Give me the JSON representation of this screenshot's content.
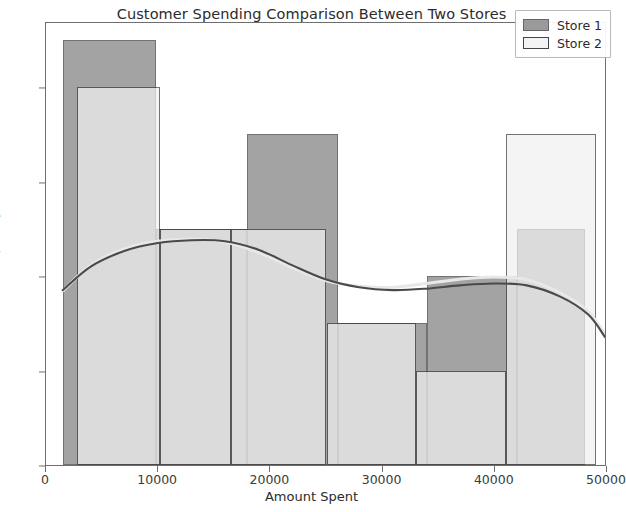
{
  "chart_data": {
    "type": "bar",
    "title": "Customer Spending Comparison Between Two Stores",
    "xlabel": "Amount Spent",
    "ylabel": "Frequency",
    "xlim": [
      0,
      50000
    ],
    "ylim": [
      0,
      9.4
    ],
    "grid": false,
    "legend_position": "upper right",
    "xticks": [
      "0",
      "10000",
      "20000",
      "30000",
      "40000",
      "50000"
    ],
    "xtick_values": [
      0,
      10000,
      20000,
      30000,
      40000,
      50000
    ],
    "yticks": [
      "0",
      "2",
      "4",
      "6",
      "8"
    ],
    "ytick_values": [
      0,
      2,
      4,
      6,
      8
    ],
    "series": [
      {
        "name": "Store 1",
        "color": "#808080",
        "edge_color": "#3c3c3c",
        "bins": [
          {
            "x0": 1500,
            "x1": 9800,
            "value": 9
          },
          {
            "x0": 9800,
            "x1": 17900,
            "value": 5
          },
          {
            "x0": 17900,
            "x1": 26000,
            "value": 7
          },
          {
            "x0": 26000,
            "x1": 34000,
            "value": 3
          },
          {
            "x0": 34000,
            "x1": 42000,
            "value": 4
          },
          {
            "x0": 42000,
            "x1": 48000,
            "value": 5
          }
        ],
        "kde": [
          [
            1500,
            3.72
          ],
          [
            4000,
            4.22
          ],
          [
            7000,
            4.55
          ],
          [
            10000,
            4.72
          ],
          [
            13000,
            4.78
          ],
          [
            16000,
            4.76
          ],
          [
            19000,
            4.58
          ],
          [
            22000,
            4.25
          ],
          [
            25000,
            3.95
          ],
          [
            28000,
            3.78
          ],
          [
            31000,
            3.72
          ],
          [
            34000,
            3.75
          ],
          [
            37000,
            3.82
          ],
          [
            40000,
            3.86
          ],
          [
            43000,
            3.82
          ],
          [
            46000,
            3.58
          ],
          [
            48500,
            3.2
          ],
          [
            50000,
            2.72
          ]
        ]
      },
      {
        "name": "Store 2",
        "color": "#f1f1f1",
        "edge_color": "#3c3c3c",
        "bins": [
          {
            "x0": 2800,
            "x1": 10200,
            "value": 8
          },
          {
            "x0": 10200,
            "x1": 16500,
            "value": 5
          },
          {
            "x0": 16500,
            "x1": 25000,
            "value": 5
          },
          {
            "x0": 25000,
            "x1": 33000,
            "value": 3
          },
          {
            "x0": 33000,
            "x1": 41000,
            "value": 2
          },
          {
            "x0": 41000,
            "x1": 49000,
            "value": 7
          }
        ],
        "kde": [
          [
            1500,
            3.7
          ],
          [
            4000,
            4.25
          ],
          [
            7000,
            4.6
          ],
          [
            10000,
            4.76
          ],
          [
            13000,
            4.8
          ],
          [
            16000,
            4.74
          ],
          [
            19000,
            4.52
          ],
          [
            22000,
            4.2
          ],
          [
            25000,
            3.92
          ],
          [
            28000,
            3.8
          ],
          [
            31000,
            3.78
          ],
          [
            34000,
            3.86
          ],
          [
            37000,
            3.95
          ],
          [
            40000,
            4.0
          ],
          [
            43000,
            3.94
          ],
          [
            46000,
            3.66
          ],
          [
            48500,
            3.26
          ],
          [
            50000,
            2.78
          ]
        ]
      }
    ]
  },
  "legend": {
    "items": [
      {
        "label": "Store 1"
      },
      {
        "label": "Store 2"
      }
    ]
  }
}
